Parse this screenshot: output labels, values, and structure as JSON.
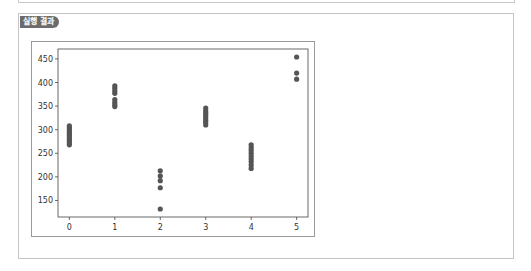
{
  "result_label": "실행 결과",
  "chart_data": {
    "type": "scatter",
    "title": "",
    "xlabel": "",
    "ylabel": "",
    "xlim": [
      -0.25,
      5.25
    ],
    "ylim": [
      115,
      471
    ],
    "grid": false,
    "legend": null,
    "marker_color": "#555555",
    "x_ticks": [
      0,
      1,
      2,
      3,
      4,
      5
    ],
    "y_ticks": [
      150,
      200,
      250,
      300,
      350,
      400,
      450
    ],
    "points": [
      {
        "x": 0,
        "y": 268
      },
      {
        "x": 0,
        "y": 272
      },
      {
        "x": 0,
        "y": 276
      },
      {
        "x": 0,
        "y": 280
      },
      {
        "x": 0,
        "y": 284
      },
      {
        "x": 0,
        "y": 288
      },
      {
        "x": 0,
        "y": 292
      },
      {
        "x": 0,
        "y": 296
      },
      {
        "x": 0,
        "y": 300
      },
      {
        "x": 0,
        "y": 304
      },
      {
        "x": 0,
        "y": 308
      },
      {
        "x": 1,
        "y": 393
      },
      {
        "x": 1,
        "y": 388
      },
      {
        "x": 1,
        "y": 382
      },
      {
        "x": 1,
        "y": 377
      },
      {
        "x": 1,
        "y": 364
      },
      {
        "x": 1,
        "y": 358
      },
      {
        "x": 1,
        "y": 353
      },
      {
        "x": 1,
        "y": 349
      },
      {
        "x": 2,
        "y": 213
      },
      {
        "x": 2,
        "y": 202
      },
      {
        "x": 2,
        "y": 192
      },
      {
        "x": 2,
        "y": 177
      },
      {
        "x": 2,
        "y": 132
      },
      {
        "x": 3,
        "y": 310
      },
      {
        "x": 3,
        "y": 315
      },
      {
        "x": 3,
        "y": 320
      },
      {
        "x": 3,
        "y": 325
      },
      {
        "x": 3,
        "y": 330
      },
      {
        "x": 3,
        "y": 335
      },
      {
        "x": 3,
        "y": 340
      },
      {
        "x": 3,
        "y": 346
      },
      {
        "x": 4,
        "y": 218
      },
      {
        "x": 4,
        "y": 225
      },
      {
        "x": 4,
        "y": 232
      },
      {
        "x": 4,
        "y": 238
      },
      {
        "x": 4,
        "y": 244
      },
      {
        "x": 4,
        "y": 250
      },
      {
        "x": 4,
        "y": 256
      },
      {
        "x": 4,
        "y": 262
      },
      {
        "x": 4,
        "y": 268
      },
      {
        "x": 5,
        "y": 454
      },
      {
        "x": 5,
        "y": 420
      },
      {
        "x": 5,
        "y": 407
      }
    ]
  }
}
